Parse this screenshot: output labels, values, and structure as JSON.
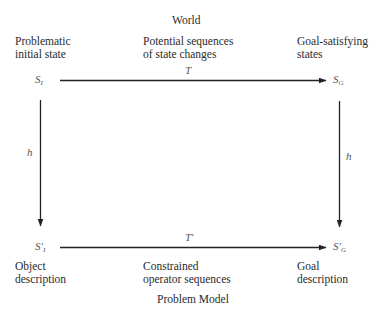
{
  "diagram": {
    "top_title": "World",
    "bottom_title": "Problem Model",
    "top_row": {
      "left_label": [
        "Problematic",
        "initial state"
      ],
      "middle_label": [
        "Potential sequences",
        "of state changes"
      ],
      "right_label": [
        "Goal-satisfying",
        "states"
      ]
    },
    "bottom_row": {
      "left_label": [
        "Object",
        "description"
      ],
      "middle_label": [
        "Constrained",
        "operator sequences"
      ],
      "right_label": [
        "Goal",
        "description"
      ]
    },
    "nodes": {
      "initial_state": {
        "symbol": "S",
        "subscript": "I"
      },
      "goal_state": {
        "symbol": "S",
        "subscript": "G"
      },
      "initial_model": {
        "symbol": "S′",
        "subscript": "I"
      },
      "goal_model": {
        "symbol": "S′",
        "subscript": "G"
      }
    },
    "edges": {
      "top_transform": "T",
      "bottom_transform": "T′",
      "left_mapping": "h",
      "right_mapping": "h"
    },
    "colors": {
      "line": "#222222",
      "text": "#2b2b2b",
      "symbol": "#555555"
    }
  }
}
